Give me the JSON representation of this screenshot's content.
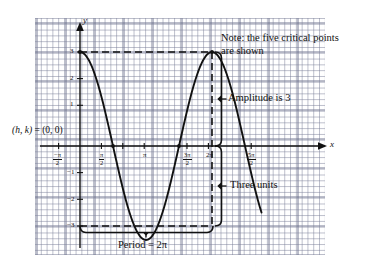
{
  "figure": {
    "kind": "trigonometric-graph",
    "axes": {
      "x_axis_label": "x",
      "y_axis_label": "y",
      "x_ticks": [
        {
          "id": "t-neg-pi-2",
          "num": "−π",
          "den": "2",
          "value": -1.5708
        },
        {
          "id": "t-pi-2",
          "num": "π",
          "den": "2",
          "value": 1.5708
        },
        {
          "id": "t-pi",
          "plain": "π",
          "value": 3.1416
        },
        {
          "id": "t-3pi-2",
          "num": "3π",
          "den": "2",
          "value": 4.7124
        },
        {
          "id": "t-2pi",
          "plain": "2π",
          "value": 6.2832
        },
        {
          "id": "t-5pi-2",
          "num": "5π",
          "den": "2",
          "value": 7.854
        }
      ],
      "y_ticks": [
        "3",
        "2",
        "1",
        "−1",
        "−2",
        "−3"
      ]
    },
    "annotations": {
      "origin": "(h, k) = (0, 0)",
      "note_line1": "Note: the five critical points",
      "note_line2": "are shown",
      "amplitude": "Amplitude is 3",
      "three_units": "Three units",
      "period": "Period = 2π"
    },
    "colors": {
      "curve": "#111111",
      "grid_minor": "#787d96",
      "grid_major": "#5f6482",
      "axis": "#111111",
      "background": "#ffffff"
    }
  },
  "chart_data": {
    "type": "line",
    "title": "",
    "subtitle": "",
    "xlabel": "x",
    "ylabel": "y",
    "function": "y = 3 cos(x)",
    "amplitude": 3,
    "period": 6.2832,
    "phase_shift_h": 0,
    "vertical_shift_k": 0,
    "xlim": [
      -1.8326,
      8.6394
    ],
    "ylim": [
      -3.9,
      3.9
    ],
    "grid": true,
    "legend": "none",
    "x_tick_values": [
      -1.5708,
      1.5708,
      3.1416,
      4.7124,
      6.2832,
      7.854
    ],
    "x_tick_labels": [
      "-π/2",
      "π/2",
      "π",
      "3π/2",
      "2π",
      "5π/2"
    ],
    "y_tick_values": [
      3,
      2,
      1,
      -1,
      -2,
      -3
    ],
    "y_tick_labels": [
      "3",
      "2",
      "1",
      "-1",
      "-2",
      "-3"
    ],
    "critical_points": [
      {
        "label": "maximum",
        "x": 0,
        "y": 3
      },
      {
        "label": "x-intercept",
        "x": 1.5708,
        "y": 0
      },
      {
        "label": "minimum",
        "x": 3.1416,
        "y": -3
      },
      {
        "label": "x-intercept",
        "x": 4.7124,
        "y": 0
      },
      {
        "label": "maximum",
        "x": 6.2832,
        "y": 3
      }
    ],
    "series": [
      {
        "name": "y = 3 cos(x)",
        "x": [
          0,
          0.2618,
          0.5236,
          0.7854,
          1.0472,
          1.309,
          1.5708,
          1.8326,
          2.0944,
          2.3562,
          2.618,
          2.8798,
          3.1416,
          3.4034,
          3.6652,
          3.927,
          4.1888,
          4.4506,
          4.7124,
          4.9742,
          5.236,
          5.4978,
          5.7596,
          6.0214,
          6.2832
        ],
        "y": [
          3,
          2.898,
          2.598,
          2.121,
          1.5,
          0.776,
          0,
          -0.776,
          -1.5,
          -2.121,
          -2.598,
          -2.898,
          -3,
          -2.898,
          -2.598,
          -2.121,
          -1.5,
          -0.776,
          0,
          0.776,
          1.5,
          2.121,
          2.598,
          2.898,
          3
        ]
      }
    ],
    "guides": [
      {
        "name": "dashed-line-y-equals-3",
        "type": "horizontal-dashed",
        "y": 3,
        "x_from": 0,
        "x_to": 6.2832
      },
      {
        "name": "dashed-line-y-equals-neg3",
        "type": "horizontal-dashed",
        "y": -3,
        "x_from": 0,
        "x_to": 6.2832
      },
      {
        "name": "dashed-line-x-equals-2pi",
        "type": "vertical-dashed",
        "x": 6.2832,
        "y_from": -3,
        "y_to": 3
      },
      {
        "name": "amplitude-bracket",
        "type": "bracket",
        "x": 6.2832,
        "y_from": 0,
        "y_to": 3,
        "label": "Amplitude is 3"
      },
      {
        "name": "three-units-bracket",
        "type": "bracket",
        "x": 6.2832,
        "y_from": -3,
        "y_to": 0,
        "label": "Three units"
      },
      {
        "name": "period-bracket",
        "type": "bracket",
        "y": -3,
        "x_from": 0,
        "x_to": 6.2832,
        "label": "Period = 2π"
      }
    ]
  }
}
